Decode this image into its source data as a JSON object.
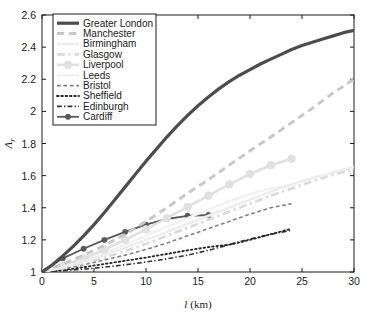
{
  "chart_data": {
    "type": "line",
    "title": "",
    "xlabel": "l (km)",
    "ylabel": "Λr",
    "ylabel_base": "Λ",
    "ylabel_sub": "r",
    "xlim": [
      0,
      30
    ],
    "ylim": [
      1,
      2.6
    ],
    "xticks": [
      "0",
      "5",
      "10",
      "15",
      "20",
      "25",
      "30"
    ],
    "xtick_values": [
      0,
      5,
      10,
      15,
      20,
      25,
      30
    ],
    "yticks": [
      "1",
      "1.2",
      "1.4",
      "1.6",
      "1.8",
      "2",
      "2.2",
      "2.4",
      "2.6"
    ],
    "ytick_values": [
      1,
      1.2,
      1.4,
      1.6,
      1.8,
      2,
      2.2,
      2.4,
      2.6
    ],
    "grid": false,
    "legend_position": "top-left",
    "series": [
      {
        "name": "Greater London",
        "style": "solid",
        "marker": "none",
        "color": "#4d4d4d",
        "width": 3.2,
        "x": [
          0,
          1,
          2,
          3,
          4,
          5,
          6,
          7,
          8,
          9,
          10,
          11,
          12,
          13,
          14,
          15,
          16,
          17,
          18,
          19,
          20,
          21,
          22,
          23,
          24,
          25,
          26,
          27,
          28,
          29,
          30
        ],
        "y": [
          1.0,
          1.045,
          1.1,
          1.16,
          1.225,
          1.295,
          1.37,
          1.45,
          1.53,
          1.61,
          1.69,
          1.765,
          1.84,
          1.91,
          1.975,
          2.035,
          2.09,
          2.14,
          2.185,
          2.225,
          2.26,
          2.295,
          2.325,
          2.355,
          2.385,
          2.41,
          2.43,
          2.45,
          2.47,
          2.49,
          2.505
        ]
      },
      {
        "name": "Manchester",
        "style": "dashed",
        "marker": "none",
        "color": "#c8c8c8",
        "width": 3.0,
        "x": [
          0,
          2,
          4,
          6,
          8,
          10,
          12,
          14,
          16,
          18,
          20,
          22,
          24,
          26,
          28,
          30
        ],
        "y": [
          1.0,
          1.05,
          1.105,
          1.165,
          1.235,
          1.315,
          1.4,
          1.49,
          1.575,
          1.665,
          1.755,
          1.84,
          1.93,
          2.02,
          2.115,
          2.2
        ]
      },
      {
        "name": "Birmingham",
        "style": "solid",
        "marker": "none",
        "color": "#ededed",
        "width": 2.6,
        "x": [
          0,
          2,
          4,
          6,
          8,
          10,
          12,
          14,
          16,
          18,
          20,
          22,
          24,
          26,
          28,
          30
        ],
        "y": [
          1.0,
          1.03,
          1.065,
          1.105,
          1.15,
          1.2,
          1.25,
          1.3,
          1.35,
          1.4,
          1.45,
          1.5,
          1.545,
          1.585,
          1.62,
          1.655
        ]
      },
      {
        "name": "Glasgow",
        "style": "dashdot",
        "marker": "none",
        "color": "#d9d9d9",
        "width": 2.6,
        "x": [
          0,
          2,
          4,
          6,
          8,
          10,
          12,
          14,
          16,
          18,
          20,
          22,
          24,
          26,
          28,
          30
        ],
        "y": [
          1.0,
          1.025,
          1.055,
          1.09,
          1.13,
          1.175,
          1.225,
          1.275,
          1.325,
          1.375,
          1.425,
          1.475,
          1.52,
          1.565,
          1.605,
          1.64
        ]
      },
      {
        "name": "Liverpool",
        "style": "solid",
        "marker": "circle",
        "color": "#e0e0e0",
        "width": 2.6,
        "x": [
          0,
          2,
          4,
          6,
          8,
          10,
          12,
          14,
          16,
          18,
          20,
          22,
          24
        ],
        "y": [
          1.0,
          1.04,
          1.085,
          1.14,
          1.2,
          1.265,
          1.335,
          1.405,
          1.475,
          1.545,
          1.61,
          1.665,
          1.705
        ]
      },
      {
        "name": "Leeds",
        "style": "solid",
        "marker": "none",
        "color": "#f2f2f2",
        "width": 2.6,
        "x": [
          0,
          2,
          4,
          6,
          8,
          10,
          12,
          14,
          16,
          18,
          20,
          22,
          24
        ],
        "y": [
          1.0,
          1.035,
          1.075,
          1.12,
          1.17,
          1.225,
          1.28,
          1.335,
          1.39,
          1.44,
          1.485,
          1.52,
          1.545
        ]
      },
      {
        "name": "Bristol",
        "style": "dashed",
        "marker": "none",
        "color": "#808080",
        "width": 1.6,
        "x": [
          0,
          2,
          4,
          6,
          8,
          10,
          12,
          14,
          16,
          18,
          20,
          22,
          24
        ],
        "y": [
          1.0,
          1.02,
          1.045,
          1.075,
          1.105,
          1.14,
          1.18,
          1.225,
          1.27,
          1.315,
          1.36,
          1.4,
          1.425
        ]
      },
      {
        "name": "Sheffield",
        "style": "dotted",
        "marker": "none",
        "color": "#262626",
        "width": 1.8,
        "x": [
          0,
          2,
          4,
          6,
          8,
          10,
          12,
          14,
          16,
          18,
          20,
          22,
          24
        ],
        "y": [
          1.0,
          1.012,
          1.03,
          1.05,
          1.07,
          1.09,
          1.112,
          1.135,
          1.155,
          1.17,
          1.2,
          1.235,
          1.27
        ]
      },
      {
        "name": "Edinburgh",
        "style": "dashdot",
        "marker": "none",
        "color": "#333333",
        "width": 1.6,
        "x": [
          0,
          2,
          4,
          6,
          8,
          10,
          12,
          14,
          16,
          18,
          20,
          22,
          24
        ],
        "y": [
          1.0,
          1.008,
          1.018,
          1.03,
          1.045,
          1.062,
          1.082,
          1.105,
          1.135,
          1.17,
          1.205,
          1.235,
          1.26
        ]
      },
      {
        "name": "Cardiff",
        "style": "solid",
        "marker": "circle",
        "color": "#595959",
        "width": 1.8,
        "x": [
          0,
          2,
          4,
          6,
          8,
          10,
          12,
          14,
          16
        ],
        "y": [
          1.0,
          1.085,
          1.145,
          1.2,
          1.25,
          1.295,
          1.33,
          1.35,
          1.355
        ]
      }
    ]
  },
  "legend": {
    "items": [
      {
        "label": "Greater London"
      },
      {
        "label": "Manchester"
      },
      {
        "label": "Birmingham"
      },
      {
        "label": "Glasgow"
      },
      {
        "label": "Liverpool"
      },
      {
        "label": "Leeds"
      },
      {
        "label": "Bristol"
      },
      {
        "label": "Sheffield"
      },
      {
        "label": "Edinburgh"
      },
      {
        "label": "Cardiff"
      }
    ]
  },
  "colors": {
    "axis": "#1a1a1a",
    "background": "#ffffff",
    "legend_border": "#1a1a1a"
  }
}
